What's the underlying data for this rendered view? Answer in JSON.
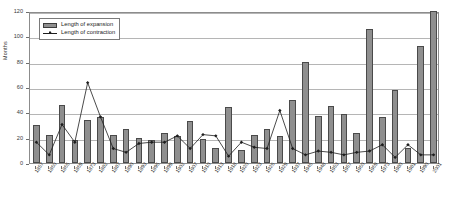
{
  "chart_data": {
    "type": "bar",
    "title": "",
    "xlabel": "",
    "ylabel": "Months",
    "ylim": [
      0,
      120
    ],
    "yticks": [
      0,
      20,
      40,
      60,
      80,
      100,
      120
    ],
    "grid": true,
    "legend_position": "top-left",
    "categories": [
      "1857",
      "1860",
      "1865",
      "1869",
      "1873",
      "1882",
      "1887",
      "1890",
      "1893",
      "1895",
      "1899",
      "1902",
      "1907",
      "1910",
      "1913",
      "1918",
      "1920",
      "1923",
      "1926",
      "1929",
      "1937",
      "1945",
      "1948",
      "1953",
      "1957",
      "1960",
      "1969",
      "1973",
      "1980",
      "1981",
      "1990",
      "2001"
    ],
    "series": [
      {
        "name": "Length of expansion",
        "type": "bar",
        "values": [
          30,
          22,
          46,
          18,
          34,
          36,
          22,
          27,
          20,
          18,
          24,
          21,
          33,
          19,
          12,
          44,
          10,
          22,
          27,
          21,
          50,
          80,
          37,
          45,
          39,
          24,
          106,
          36,
          58,
          12,
          92,
          120
        ]
      },
      {
        "name": "Length of contraction",
        "type": "line",
        "values": [
          18,
          8,
          32,
          18,
          65,
          38,
          13,
          10,
          17,
          18,
          18,
          23,
          13,
          24,
          23,
          7,
          18,
          14,
          13,
          43,
          13,
          8,
          11,
          10,
          8,
          10,
          11,
          16,
          6,
          16,
          8,
          8
        ]
      }
    ],
    "legend": [
      "Length of expansion",
      "Length of contraction"
    ],
    "colors": {
      "bar_fill": "#8f8f8f",
      "bar_edge": "#4a4a4a",
      "line": "#1d1d1d",
      "grid": "#b5b5b5",
      "frame": "#8c8c8c"
    }
  }
}
